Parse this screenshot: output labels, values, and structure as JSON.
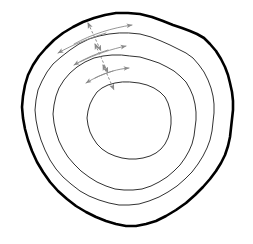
{
  "figure": {
    "background_color": "#ffffff",
    "width": 253,
    "height": 244
  },
  "style": {
    "outer_contour_color": "#000000",
    "outer_contour_width": 2.6,
    "inner_contour_color": "#1a1a1a",
    "inner_contour_width": 0.9,
    "arrow_color": "#8a8a8a",
    "arrow_width": 0.9,
    "radial_arrow_color": "#8a8a8a",
    "radial_arrow_width": 1.0,
    "radial_arrow_dash": "2.5 2"
  },
  "chart_data": {
    "type": "line",
    "xlabel": "",
    "ylabel": "",
    "grid": false,
    "legend": "none",
    "xlim": [
      0,
      253
    ],
    "ylim": [
      0,
      244
    ],
    "contours": [
      {
        "name": "contour-ring-1-outermost",
        "rank": 1,
        "stroke_width": 2.6,
        "stroke_color": "#000000",
        "center": [
          128,
          120
        ],
        "mean_radius": 105,
        "path": "M 128 13 L 140 14 L 152 17 L 163 21 L 173 25 L 182 28 L 190 31 L 197 34 L 204 38 L 210 44 L 216 51 L 221 59 L 225 67 L 228 75 L 230 83 L 232 92 L 233 101 L 233 110 L 232 119 L 231 128 L 230 137 L 228 146 L 225 155 L 221 163 L 216 171 L 210 179 L 203 187 L 195 195 L 186 203 L 176 210 L 166 216 L 156 221 L 146 224 L 136 226 L 126 226 L 116 224 L 106 221 L 96 217 L 86 212 L 76 206 L 67 199 L 58 191 L 50 182 L 43 172 L 37 162 L 32 151 L 28 140 L 25 129 L 23 118 L 22 107 L 23 96 L 25 85 L 28 75 L 33 65 L 39 56 L 46 48 L 54 40 L 63 33 L 73 27 L 83 22 L 94 18 L 105 15 L 116 13 Z"
      },
      {
        "name": "contour-ring-2",
        "rank": 2,
        "stroke_width": 0.9,
        "stroke_color": "#1a1a1a",
        "center": [
          128,
          122
        ],
        "mean_radius": 88,
        "path": "M 129 33 L 140 34 L 151 37 L 161 41 L 170 45 L 178 49 L 186 53 L 193 58 L 199 65 L 204 72 L 208 80 L 211 88 L 213 96 L 214 104 L 214 113 L 213 122 L 212 131 L 210 140 L 207 148 L 203 156 L 198 164 L 192 172 L 185 179 L 177 186 L 168 192 L 159 197 L 149 201 L 139 204 L 129 205 L 119 205 L 109 203 L 99 200 L 89 196 L 80 191 L 71 184 L 63 177 L 56 169 L 50 160 L 45 150 L 41 140 L 38 130 L 36 120 L 35 110 L 36 100 L 38 90 L 42 81 L 47 72 L 53 64 L 61 57 L 70 50 L 79 44 L 89 39 L 99 36 L 109 34 L 119 33 Z"
      },
      {
        "name": "contour-ring-3",
        "rank": 3,
        "stroke_width": 0.9,
        "stroke_color": "#1a1a1a",
        "center": [
          129,
          124
        ],
        "mean_radius": 68,
        "path": "M 130 56 L 140 57 L 150 60 L 159 63 L 167 67 L 174 71 L 180 76 L 186 82 L 190 89 L 193 96 L 195 104 L 196 112 L 196 120 L 195 128 L 194 136 L 192 144 L 189 151 L 185 158 L 180 165 L 174 171 L 167 177 L 159 182 L 151 186 L 142 189 L 133 190 L 124 190 L 115 189 L 106 186 L 97 182 L 89 177 L 81 171 L 74 164 L 68 157 L 63 149 L 59 141 L 56 132 L 54 123 L 53 114 L 54 105 L 56 96 L 59 88 L 64 80 L 70 73 L 77 67 L 85 62 L 94 58 L 103 56 L 112 55 L 121 55 Z"
      },
      {
        "name": "contour-ring-4-innermost",
        "rank": 4,
        "stroke_width": 0.9,
        "stroke_color": "#1a1a1a",
        "center": [
          129,
          122
        ],
        "mean_radius": 42,
        "path": "M 130 82 L 139 83 L 147 85 L 154 88 L 160 92 L 165 97 L 168 103 L 170 110 L 171 117 L 171 124 L 170 131 L 168 138 L 165 144 L 161 149 L 156 153 L 150 156 L 143 158 L 136 159 L 129 159 L 122 158 L 115 156 L 108 153 L 102 149 L 97 144 L 93 138 L 90 132 L 88 125 L 87 118 L 88 111 L 90 104 L 93 98 L 97 92 L 102 88 L 108 85 L 115 83 L 122 82 Z"
      }
    ],
    "flow_arrows": [
      {
        "name": "flow-arrow-ring1-rightward",
        "direction": "right",
        "ring": 1,
        "path": "M 74 44 C 92 34, 112 28, 132 25",
        "head_at": "end"
      },
      {
        "name": "flow-arrow-ring1-leftward",
        "direction": "left",
        "ring": 1,
        "path": "M 106 33 C 90 38, 74 44, 58 53",
        "head_at": "end"
      },
      {
        "name": "flow-arrow-ring2-rightward",
        "direction": "right",
        "ring": 2,
        "path": "M 80 62 C 96 54, 112 49, 126 46",
        "head_at": "end"
      },
      {
        "name": "flow-arrow-ring2-leftward",
        "direction": "left",
        "ring": 2,
        "path": "M 108 50 C 95 54, 84 59, 74 65",
        "head_at": "end"
      },
      {
        "name": "flow-arrow-ring3-rightward",
        "direction": "right",
        "ring": 3,
        "path": "M 95 78 C 107 72, 118 69, 129 68",
        "head_at": "end"
      },
      {
        "name": "flow-arrow-ring3-leftward",
        "direction": "left",
        "ring": 3,
        "path": "M 113 71 C 103 74, 94 78, 86 83",
        "head_at": "end"
      }
    ],
    "radial_arrows": [
      {
        "name": "radial-arrow-outer",
        "style": "dashed-double-headed",
        "x1": 88,
        "y1": 23,
        "x2": 101,
        "y2": 51,
        "heads": "both"
      },
      {
        "name": "radial-arrow-middle",
        "style": "dashed-double-headed",
        "x1": 95,
        "y1": 44,
        "x2": 108,
        "y2": 73,
        "heads": "both"
      },
      {
        "name": "radial-arrow-inner",
        "style": "dashed-double-headed",
        "x1": 103,
        "y1": 65,
        "x2": 114,
        "y2": 90,
        "heads": "both"
      }
    ]
  }
}
